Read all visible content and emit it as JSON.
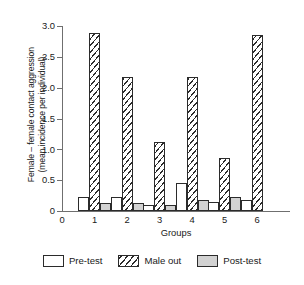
{
  "chart_data": {
    "type": "bar",
    "title": "",
    "subtitle": "",
    "xlabel": "Groups",
    "ylabel": "Female – female contact aggression (mean incidence per individual)",
    "ylabel_line1": "Female – female contact aggression",
    "ylabel_line2": "(mean incidence per individual)",
    "categories": [
      "1",
      "2",
      "3",
      "4",
      "5",
      "6"
    ],
    "xtick_labels": [
      "0",
      "1",
      "2",
      "3",
      "4",
      "5",
      "6"
    ],
    "ytick_labels": [
      "0",
      "0.5",
      "1.0",
      "1.5",
      "2.0",
      "2.5",
      "3.0"
    ],
    "ytick_values": [
      0,
      0.5,
      1.0,
      1.5,
      2.0,
      2.5,
      3.0
    ],
    "ylim": [
      0,
      3.0
    ],
    "grid": false,
    "legend_position": "bottom",
    "series": [
      {
        "name": "Pre-test",
        "fill": "#ffffff",
        "values": [
          0.22,
          0.22,
          0.1,
          0.45,
          0.14,
          0.18
        ]
      },
      {
        "name": "Male out",
        "fill": "hatched",
        "values": [
          2.89,
          2.18,
          1.12,
          2.17,
          0.86,
          2.86
        ]
      },
      {
        "name": "Post-test",
        "fill": "#d2d2d2",
        "values": [
          0.13,
          0.13,
          0.1,
          0.18,
          0.23,
          0
        ]
      }
    ]
  },
  "legend": {
    "items": [
      {
        "label": "Pre-test",
        "swatch": "pre"
      },
      {
        "label": "Male out",
        "swatch": "maleout"
      },
      {
        "label": "Post-test",
        "swatch": "post"
      }
    ]
  }
}
